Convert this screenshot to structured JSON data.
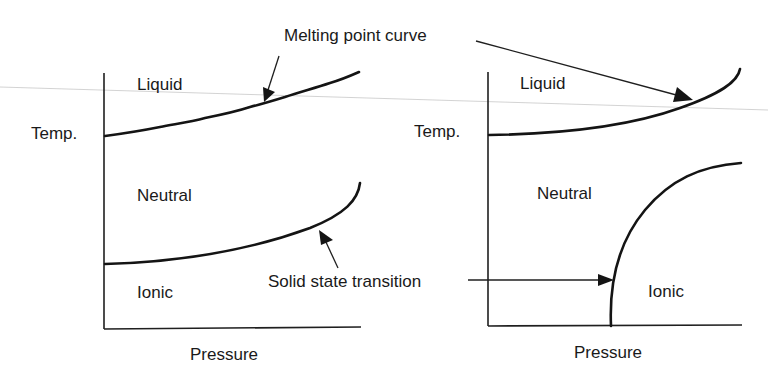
{
  "figure": {
    "annotations": {
      "melting_point": "Melting point curve",
      "solid_state": "Solid state transition"
    },
    "left_panel": {
      "y_label": "Temp.",
      "x_label": "Pressure",
      "regions": {
        "liquid": "Liquid",
        "neutral": "Neutral",
        "ionic": "Ionic"
      }
    },
    "right_panel": {
      "y_label": "Temp.",
      "x_label": "Pressure",
      "regions": {
        "liquid": "Liquid",
        "neutral": "Neutral",
        "ionic": "Ionic"
      }
    },
    "colors": {
      "ink": "#141414",
      "background": "#ffffff",
      "scan_line": "#c8c8c8"
    }
  }
}
